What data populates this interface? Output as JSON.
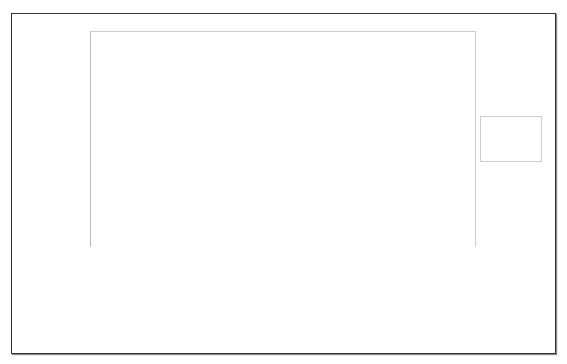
{
  "chart_data": {
    "type": "bar",
    "stacked": "percent",
    "title": "",
    "xlabel": "",
    "ylabel": "% at least moderate PCHI",
    "ylim": [
      0,
      100
    ],
    "yticks": [
      "0%",
      "10%",
      "20%",
      "30%",
      "40%",
      "50%",
      "60%",
      "70%",
      "80%",
      "90%",
      "100%"
    ],
    "categories": [
      [
        "CDC 2008",
        "congenital",
        "2006",
        "USA"
      ],
      [
        "Maki-Torkko et al. 1998",
        "congenital",
        "1973-92",
        "Finland"
      ],
      [
        "Fortnum et al. 2002",
        "age 3-16",
        "1980-95",
        "UK"
      ]
    ],
    "series": [
      {
        "name": "Moderate",
        "color": "#555555",
        "values": [
          1280,
          117,
          9084
        ]
      },
      {
        "name": "Severe",
        "color": "#aaaaaa",
        "values": [
          595,
          25,
          3599
        ]
      },
      {
        "name": "Profound",
        "color": "#f7f7f7",
        "values": [
          808,
          67,
          4262
        ]
      }
    ],
    "legend": {
      "position": "right",
      "entries": [
        "Profound",
        "Severe",
        "Moderate"
      ]
    },
    "grid": false
  }
}
